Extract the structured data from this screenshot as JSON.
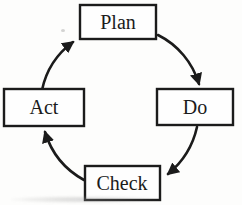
{
  "diagram": {
    "type": "cycle",
    "name": "PDCA cycle",
    "background_color": "#fdfdfc",
    "line_color": "#1b1b1b",
    "box_fill": "#fefefe",
    "nodes": [
      {
        "id": "plan",
        "label": "Plan",
        "position": "top"
      },
      {
        "id": "do",
        "label": "Do",
        "position": "right"
      },
      {
        "id": "check",
        "label": "Check",
        "position": "bottom"
      },
      {
        "id": "act",
        "label": "Act",
        "position": "left"
      }
    ],
    "edges": [
      {
        "from": "Plan",
        "to": "Do",
        "direction": "clockwise"
      },
      {
        "from": "Do",
        "to": "Check",
        "direction": "clockwise"
      },
      {
        "from": "Check",
        "to": "Act",
        "direction": "clockwise"
      },
      {
        "from": "Act",
        "to": "Plan",
        "direction": "clockwise"
      }
    ]
  }
}
